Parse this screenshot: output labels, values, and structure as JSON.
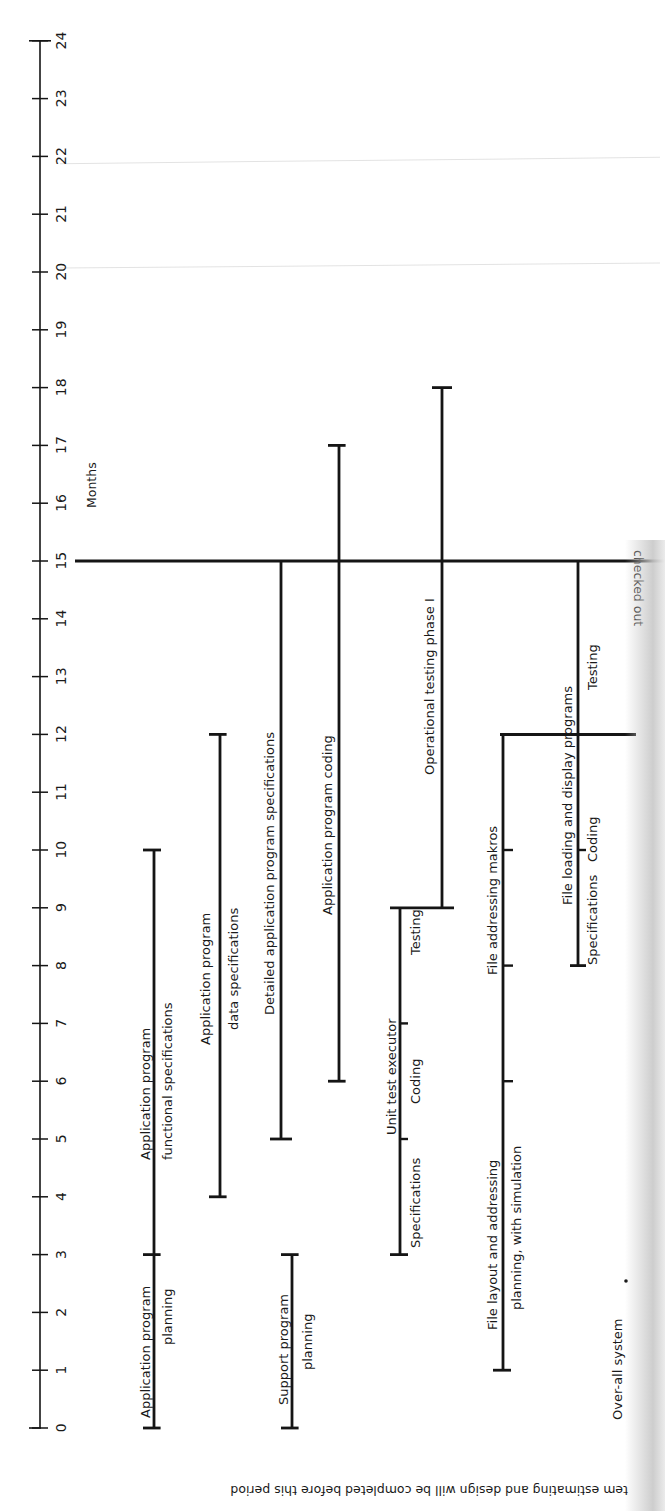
{
  "chart_data": {
    "type": "gantt",
    "title": "",
    "axis": {
      "label": "Months",
      "orientation": "vertical",
      "min": 0,
      "max": 24,
      "ticks": [
        "0",
        "1",
        "2",
        "3",
        "4",
        "5",
        "6",
        "7",
        "8",
        "9",
        "10",
        "11",
        "12",
        "13",
        "14",
        "15",
        "16",
        "17",
        "18",
        "19",
        "20",
        "21",
        "22",
        "23",
        "24"
      ]
    },
    "milestones": [
      {
        "month": 15,
        "label": "checked out",
        "note": "horizontal line across chart"
      },
      {
        "month": 12,
        "label": "",
        "note": "short horizontal line at right (file programs)"
      }
    ],
    "tasks": [
      {
        "name": "Application program planning",
        "label_lines": [
          "Application program",
          "planning"
        ],
        "start": 0,
        "end": 3
      },
      {
        "name": "Application program functional specifications",
        "label_lines": [
          "Application program",
          "functional specifications"
        ],
        "start": 3,
        "end": 10
      },
      {
        "name": "Application program data specifications",
        "label_lines": [
          "Application program",
          "data specifications"
        ],
        "start": 4,
        "end": 12
      },
      {
        "name": "Support program planning",
        "label_lines": [
          "Support program",
          "planning"
        ],
        "start": 0,
        "end": 3
      },
      {
        "name": "Detailed application program specifications",
        "label_lines": [
          "Detailed application program specifications"
        ],
        "start": 5,
        "end": 15
      },
      {
        "name": "Application program coding",
        "label_lines": [
          "Application program coding"
        ],
        "start": 6,
        "end": 17
      },
      {
        "name": "Unit test executor",
        "label_lines": [
          "Unit test executor"
        ],
        "start": 3,
        "end": 9,
        "phases": [
          {
            "name": "Specifications",
            "start": 3,
            "end": 5
          },
          {
            "name": "Coding",
            "start": 5,
            "end": 7
          },
          {
            "name": "Testing",
            "start": 7,
            "end": 9
          }
        ]
      },
      {
        "name": "Operational testing phase I",
        "label_lines": [
          "Operational testing phase I"
        ],
        "start": 9,
        "end": 18
      },
      {
        "name": "File layout and addressing planning, with simulation",
        "label_lines": [
          "File layout and addressing",
          "planning, with simulation"
        ],
        "start": 1,
        "end": 6
      },
      {
        "name": "File addressing makros",
        "label_lines": [
          "File addressing makros"
        ],
        "start": 6,
        "end": 12,
        "subticks": [
          8,
          10
        ]
      },
      {
        "name": "File loading and display programs",
        "label_lines": [
          "File loading and display programs"
        ],
        "start": 8,
        "end": 15,
        "phases": [
          {
            "name": "Specifications",
            "start": 8,
            "end": 10
          },
          {
            "name": "Coding",
            "start": 10,
            "end": 12
          },
          {
            "name": "Testing",
            "start": 12,
            "end": 15
          }
        ]
      },
      {
        "name": "Over-all system",
        "label_lines": [
          "Over-all system"
        ],
        "start": 0,
        "end": 0
      }
    ],
    "footnote": "tem estimating and design will be completed before this period",
    "grid": false
  },
  "labels": {
    "months": "Months",
    "checked_out": "checked out",
    "footnote": "tem estimating and design will be completed before this period",
    "overall": "Over-all system"
  }
}
